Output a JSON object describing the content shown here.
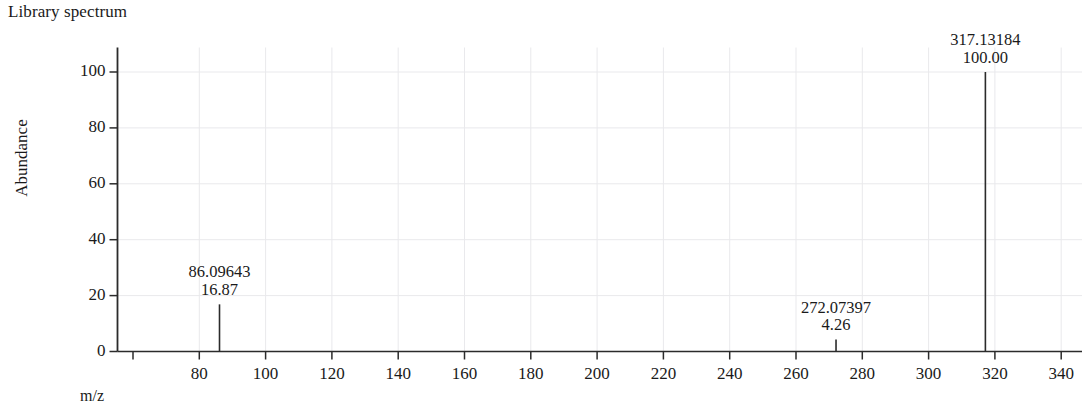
{
  "title": "Library spectrum",
  "colors": {
    "axis": "#2b2b2b",
    "grid": "#e9e9ec",
    "peak": "#2b2b2b",
    "text": "#1a1a1a",
    "background": "#ffffff"
  },
  "chart_data": {
    "type": "bar",
    "title": "Library spectrum",
    "xlabel": "m/z",
    "ylabel": "Abundance",
    "xlim": [
      55,
      345
    ],
    "ylim": [
      0,
      108
    ],
    "grid": true,
    "legend": null,
    "x_ticks": [
      80,
      100,
      120,
      140,
      160,
      180,
      200,
      220,
      240,
      260,
      280,
      300,
      320,
      340
    ],
    "x_tick_labels": [
      "80",
      "100",
      "120",
      "140",
      "160",
      "180",
      "200",
      "220",
      "240",
      "260",
      "280",
      "300",
      "320",
      "340"
    ],
    "y_ticks": [
      0,
      20,
      40,
      60,
      80,
      100
    ],
    "y_tick_labels": [
      "0",
      "20",
      "40",
      "60",
      "80",
      "100"
    ],
    "x": [
      86.09643,
      272.07397,
      317.13184
    ],
    "values": [
      16.87,
      4.26,
      100.0
    ],
    "peaks": [
      {
        "mz": 86.09643,
        "abundance": 16.87,
        "mz_label": "86.09643",
        "abundance_label": "16.87"
      },
      {
        "mz": 272.07397,
        "abundance": 4.26,
        "mz_label": "272.07397",
        "abundance_label": "4.26"
      },
      {
        "mz": 317.13184,
        "abundance": 100.0,
        "mz_label": "317.13184",
        "abundance_label": "100.00"
      }
    ]
  }
}
